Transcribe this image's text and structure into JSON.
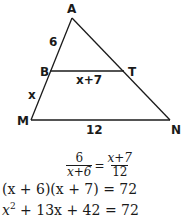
{
  "figure": {
    "vertices": {
      "A": {
        "label": "A",
        "x": 72,
        "y": 18
      },
      "B": {
        "label": "B",
        "x": 50,
        "y": 71
      },
      "T": {
        "label": "T",
        "x": 124,
        "y": 71
      },
      "M": {
        "label": "M",
        "x": 31,
        "y": 120
      },
      "N": {
        "label": "N",
        "x": 170,
        "y": 120
      }
    },
    "segment_labels": {
      "AB": "6",
      "BM": "x",
      "BT": "x+7",
      "MN": "12"
    },
    "line_color": "#1a1a1a"
  },
  "equations": {
    "proportion": {
      "left_num": "6",
      "left_den": "x+6",
      "equals": "=",
      "right_num": "x+7",
      "right_den": "12"
    },
    "line2": "(x + 6)(x + 7) = 72",
    "line3_parts": {
      "x": "x",
      "exp": "2",
      "rest": " + 13x + 42 = 72"
    }
  }
}
